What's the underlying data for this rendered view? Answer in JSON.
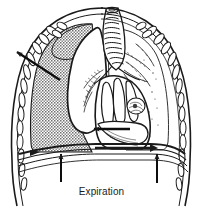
{
  "figure": {
    "title": "Expiration",
    "caption": "Expiration",
    "type": "medical-line-illustration",
    "background_color": "#ffffff",
    "ink_color": "#1a1a1a",
    "shade_color": "#9a9a9a",
    "width": 203,
    "height": 209
  },
  "labels": {
    "caption": "Expiration"
  },
  "annotations": {
    "pleural_air_arrow": {
      "name": "pneumothorax-arrow",
      "direction": "up-left",
      "from_x": 60,
      "from_y": 80,
      "to_x": 14,
      "to_y": 50
    },
    "mediastinal_shift_arrow": {
      "name": "mediastinal-shift-arrow",
      "direction": "left",
      "from_x": 130,
      "from_y": 129,
      "to_x": 92,
      "to_y": 129
    },
    "diaphragm_arrows": [
      {
        "name": "diaphragm-arrow-left",
        "direction": "up",
        "x": 61,
        "from_y": 182,
        "to_y": 152
      },
      {
        "name": "diaphragm-arrow-right",
        "direction": "up",
        "x": 157,
        "from_y": 183,
        "to_y": 152
      }
    ]
  },
  "structures": {
    "pneumothorax_region": "left pleural air space (stippled grey)",
    "collapsed_lung": "collapsed left lung (white)",
    "right_lung": "right lung with bronchial tree",
    "trachea": "trachea with cartilage rings",
    "heart": "heart and mediastinum",
    "diaphragm": "elevated diaphragm",
    "rib_cage": "rib cage with rib segments",
    "rib_count_left": 9,
    "rib_count_right": 9
  }
}
